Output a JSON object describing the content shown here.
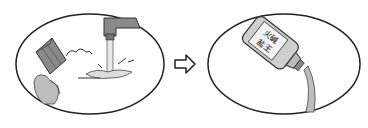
{
  "diagram": {
    "panels": [
      {
        "id": "faucet-scene",
        "description": "Water pouring from a tap, a scrubbing brush with foam"
      },
      {
        "id": "bottle-scene",
        "description": "Bottle pouring liquid",
        "label_lines": [
          "火碱",
          "盐王"
        ]
      }
    ],
    "connector": {
      "type": "arrow",
      "direction": "right"
    },
    "colors": {
      "outline": "#222222",
      "fill": "#ffffff",
      "gray": "#9a9a9a",
      "light_gray": "#c8c8c8"
    }
  }
}
